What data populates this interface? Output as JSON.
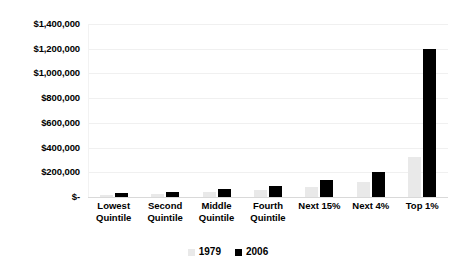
{
  "chart_data": {
    "type": "bar",
    "title": "",
    "subtitle": "",
    "xlabel": "",
    "ylabel": "",
    "ylim": [
      0,
      1400000
    ],
    "grid": true,
    "legend_position": "bottom",
    "categories": [
      "Lowest Quintile",
      "Second Quintile",
      "Middle Quintile",
      "Fourth Quintile",
      "Next 15%",
      "Next 4%",
      "Top 1%"
    ],
    "category_lines": [
      [
        "Lowest",
        "Quintile"
      ],
      [
        "Second",
        "Quintile"
      ],
      [
        "Middle",
        "Quintile"
      ],
      [
        "Fourth",
        "Quintile"
      ],
      [
        "Next 15%"
      ],
      [
        "Next 4%"
      ],
      [
        "Top 1%"
      ]
    ],
    "series": [
      {
        "name": "1979",
        "color": "#e9e9e9",
        "values": [
          16000,
          24000,
          40000,
          58000,
          80000,
          120000,
          320000
        ]
      },
      {
        "name": "2006",
        "color": "#000000",
        "values": [
          32000,
          40000,
          65000,
          90000,
          140000,
          200000,
          1200000
        ]
      }
    ],
    "y_ticks": [
      {
        "value": 1400000,
        "label": "$1,400,000"
      },
      {
        "value": 1200000,
        "label": "$1,200,000"
      },
      {
        "value": 1000000,
        "label": "$1,000,000"
      },
      {
        "value": 800000,
        "label": "$800,000"
      },
      {
        "value": 600000,
        "label": "$600,000"
      },
      {
        "value": 400000,
        "label": "$400,000"
      },
      {
        "value": 200000,
        "label": "$200,000"
      },
      {
        "value": 0,
        "label": "$-"
      }
    ],
    "legend": [
      {
        "label": "1979",
        "color": "#e9e9e9"
      },
      {
        "label": "2006",
        "color": "#000000"
      }
    ]
  }
}
